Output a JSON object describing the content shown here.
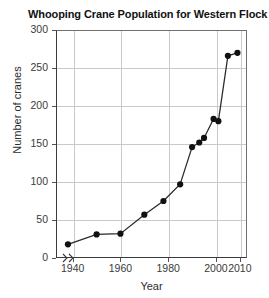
{
  "chart_data": {
    "type": "line",
    "title": "Whooping Crane Population for Western Flock",
    "xlabel": "Year",
    "ylabel": "Number of cranes",
    "xlim": [
      1933,
      2013
    ],
    "ylim": [
      0,
      300
    ],
    "xticks": [
      1940,
      1960,
      1980,
      2000,
      2010
    ],
    "xtick_labels": [
      "1940",
      "1960",
      "1980",
      "2000",
      "2010"
    ],
    "yticks": [
      0,
      50,
      100,
      150,
      200,
      250,
      300
    ],
    "ytick_labels": [
      "0",
      "50",
      "100",
      "150",
      "200",
      "250",
      "300"
    ],
    "grid": "horizontal-and-vertical",
    "legend": "none",
    "axis_break": {
      "axis": "x",
      "symbol": "⹝⹝",
      "near": "origin"
    },
    "marker": "filled-circle",
    "series": [
      {
        "name": "Whooping crane population",
        "x": [
          1938,
          1950,
          1960,
          1970,
          1978,
          1985,
          1990,
          1993,
          1995,
          1999,
          2001,
          2005,
          2009
        ],
        "y": [
          18,
          31,
          32,
          57,
          75,
          97,
          146,
          152,
          158,
          183,
          180,
          266,
          270
        ]
      }
    ],
    "points": [
      {
        "year": 1938,
        "cranes": 18
      },
      {
        "year": 1950,
        "cranes": 31
      },
      {
        "year": 1960,
        "cranes": 32
      },
      {
        "year": 1970,
        "cranes": 57
      },
      {
        "year": 1978,
        "cranes": 75
      },
      {
        "year": 1985,
        "cranes": 97
      },
      {
        "year": 1990,
        "cranes": 146
      },
      {
        "year": 1993,
        "cranes": 152
      },
      {
        "year": 1995,
        "cranes": 158
      },
      {
        "year": 1999,
        "cranes": 183
      },
      {
        "year": 2001,
        "cranes": 180
      },
      {
        "year": 2005,
        "cranes": 266
      },
      {
        "year": 2009,
        "cranes": 270
      }
    ],
    "colors": {
      "line": "#2a2a2a",
      "marker": "#111111",
      "grid": "#c9c9c9",
      "axis": "#3b3b3b"
    }
  }
}
